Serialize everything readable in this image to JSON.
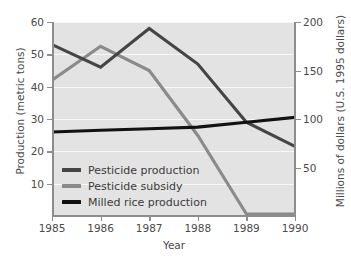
{
  "chart_data": {
    "type": "line",
    "title": "",
    "xlabel": "Year",
    "ylabel": "Production (metric tons)",
    "ylabel_right": "Millions of dollars (U.S. 1995 dollars)",
    "x": [
      1985,
      1986,
      1987,
      1988,
      1989,
      1990
    ],
    "xtick_labels": [
      "1985",
      "1986",
      "1987",
      "1988",
      "1989",
      "1990"
    ],
    "xlim": [
      1985,
      1990
    ],
    "ylim": [
      0,
      60
    ],
    "ytick_labels": [
      "10",
      "20",
      "30",
      "40",
      "50",
      "60"
    ],
    "yticks": [
      10,
      20,
      30,
      40,
      50,
      60
    ],
    "ylim_right": [
      0,
      200
    ],
    "ytick_labels_right": [
      "50",
      "100",
      "150",
      "200"
    ],
    "yticks_right": [
      50,
      100,
      150,
      200
    ],
    "grid": true,
    "grid_axis": "y",
    "legend_position": "lower left",
    "series": [
      {
        "name": "Pesticide production",
        "axis": "left",
        "color": "#454545",
        "values": [
          53,
          46,
          58,
          47,
          29,
          21.5
        ]
      },
      {
        "name": "Pesticide subsidy",
        "axis": "right",
        "color": "#8a8a8a",
        "values": [
          140,
          175,
          150,
          83,
          2,
          2
        ]
      },
      {
        "name": "Milled rice production",
        "axis": "left",
        "color": "#111111",
        "values": [
          26,
          26.5,
          27,
          27.5,
          29,
          30.5
        ]
      }
    ]
  },
  "colors": {
    "plot_background": "#e3e3e3",
    "figure_background": "#ffffff",
    "axis": "#8d8d8d",
    "tick_text": "#4a4a4a",
    "gridline": "#ffffff"
  }
}
